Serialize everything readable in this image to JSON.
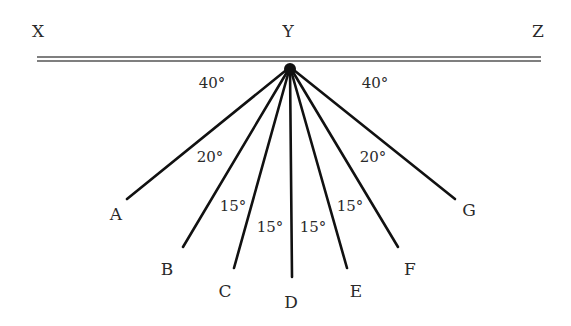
{
  "diagram": {
    "type": "angle-fan",
    "colors": {
      "line": "#111111",
      "text": "#2a2a2a",
      "surface_line": "#555555",
      "background": "#ffffff"
    },
    "apex": {
      "label": "Y",
      "x": 290,
      "y": 67
    },
    "surface_labels": [
      {
        "id": "X",
        "label": "X",
        "x": 38,
        "y": 37
      },
      {
        "id": "Y",
        "label": "Y",
        "x": 288,
        "y": 37
      },
      {
        "id": "Z",
        "label": "Z",
        "x": 538,
        "y": 37
      }
    ],
    "surface": {
      "x1": 37,
      "x2": 541,
      "y_top": 57,
      "y_bottom": 61
    },
    "rays": [
      {
        "label": "A",
        "x2": 127,
        "y2": 199,
        "label_x": 116,
        "label_y": 220
      },
      {
        "label": "B",
        "x2": 183,
        "y2": 247,
        "label_x": 167,
        "label_y": 275
      },
      {
        "label": "C",
        "x2": 234,
        "y2": 268,
        "label_x": 225,
        "label_y": 297
      },
      {
        "label": "D",
        "x2": 292,
        "y2": 277,
        "label_x": 291,
        "label_y": 308
      },
      {
        "label": "E",
        "x2": 347,
        "y2": 268,
        "label_x": 356,
        "label_y": 297
      },
      {
        "label": "F",
        "x2": 398,
        "y2": 247,
        "label_x": 410,
        "label_y": 275
      },
      {
        "label": "G",
        "x2": 455,
        "y2": 199,
        "label_x": 469,
        "label_y": 216
      }
    ],
    "angles": [
      {
        "label": "40°",
        "x": 212,
        "y": 88
      },
      {
        "label": "40°",
        "x": 375,
        "y": 88
      },
      {
        "label": "20°",
        "x": 210,
        "y": 162
      },
      {
        "label": "20°",
        "x": 373,
        "y": 162
      },
      {
        "label": "15°",
        "x": 233,
        "y": 211
      },
      {
        "label": "15°",
        "x": 350,
        "y": 211
      },
      {
        "label": "15°",
        "x": 270,
        "y": 232
      },
      {
        "label": "15°",
        "x": 313,
        "y": 232
      }
    ]
  }
}
